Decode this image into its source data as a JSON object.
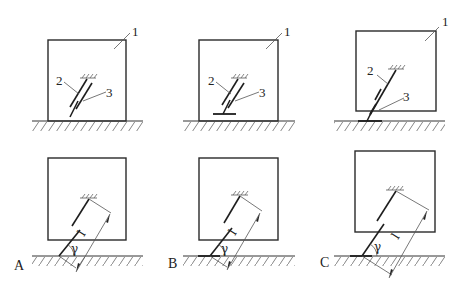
{
  "figure": {
    "top_row": {
      "callouts": [
        {
          "panel": "top-left",
          "labels": [
            "1",
            "2",
            "3"
          ]
        },
        {
          "panel": "top-middle",
          "labels": [
            "1",
            "2",
            "3"
          ]
        },
        {
          "panel": "top-right",
          "labels": [
            "1",
            "2",
            "3"
          ]
        }
      ]
    },
    "bottom_row": {
      "variants": [
        {
          "id": "A",
          "label": "A",
          "angle_symbol": "γ",
          "length_symbol": "l"
        },
        {
          "id": "B",
          "label": "B",
          "angle_symbol": "γ",
          "length_symbol": "l"
        },
        {
          "id": "C",
          "label": "C",
          "angle_symbol": "γ",
          "length_symbol": "l"
        }
      ]
    }
  },
  "labels": {
    "one": "1",
    "two": "2",
    "three": "3",
    "A": "A",
    "B": "B",
    "C": "C",
    "gamma": "γ",
    "length": "l"
  },
  "colors": {
    "line": "#2a2a2a",
    "hatch": "#666666",
    "background": "#ffffff"
  }
}
